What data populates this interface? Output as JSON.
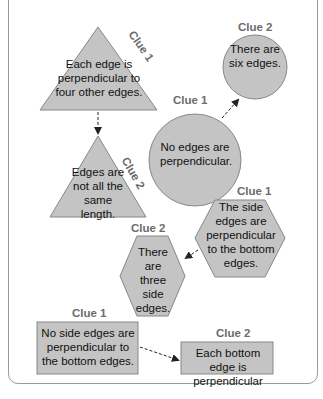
{
  "header_fragment": "... each shape has two clues; match to the clue 2 ...",
  "colors": {
    "shape_fill": "#c4c4c4",
    "shape_stroke": "#888888",
    "clue_label": "#6b6b6b",
    "arrow": "#222222"
  },
  "groups": [
    {
      "shape": "triangle",
      "clue1_label": "Clue 1",
      "clue1_text": "Each edge is perpendicular to four other edges.",
      "clue2_shape": "triangle",
      "clue2_label": "Clue 2",
      "clue2_text": "Edges are not all the same length."
    },
    {
      "shape": "circle",
      "clue1_label": "Clue 1",
      "clue1_text": "No edges are perpendicular.",
      "clue2_shape": "circle",
      "clue2_label": "Clue 2",
      "clue2_text": "There are six edges."
    },
    {
      "shape": "hexagon",
      "clue1_label": "Clue 1",
      "clue1_text": "The side edges are perpendicular to the bottom edges.",
      "clue2_shape": "hexagon",
      "clue2_label": "Clue 2",
      "clue2_text": "There are three side edges."
    },
    {
      "shape": "rectangle",
      "clue1_label": "Clue 1",
      "clue1_text": "No side edges are perpendicular to the bottom edges.",
      "clue2_shape": "rectangle",
      "clue2_label": "Clue 2",
      "clue2_text": "Each bottom edge is perpendicular"
    }
  ]
}
